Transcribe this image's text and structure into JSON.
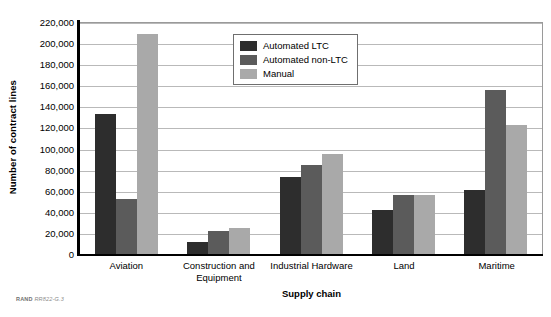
{
  "credit": {
    "org": "RAND",
    "code": "RR822-G.3"
  },
  "legend": {
    "position": "upper-center",
    "items": [
      {
        "label": "Automated LTC",
        "color": "#2d2d2d"
      },
      {
        "label": "Automated non-LTC",
        "color": "#5b5b5b"
      },
      {
        "label": "Manual",
        "color": "#a9a9a9"
      }
    ]
  },
  "chart_data": {
    "type": "bar",
    "title": "",
    "subtitle": "",
    "xlabel": "Supply chain",
    "ylabel": "Number of contract lines",
    "ylim": [
      0,
      220000
    ],
    "ytick_step": 20000,
    "ytick_labels": [
      "220,000",
      "200,000",
      "180,000",
      "160,000",
      "140,000",
      "120,000",
      "100,000",
      "80,000",
      "60,000",
      "40,000",
      "20,000",
      "0"
    ],
    "grid": true,
    "legend_position": "upper-center",
    "categories": [
      "Aviation",
      "Construction and Equipment",
      "Industrial Hardware",
      "Land",
      "Maritime"
    ],
    "series": [
      {
        "name": "Automated LTC",
        "color": "#2d2d2d",
        "values": [
          133000,
          11000,
          73000,
          42000,
          60500
        ]
      },
      {
        "name": "Automated non-LTC",
        "color": "#5b5b5b",
        "values": [
          52000,
          22000,
          84000,
          55500,
          156000
        ]
      },
      {
        "name": "Manual",
        "color": "#a9a9a9",
        "values": [
          208500,
          25000,
          95000,
          56000,
          122000
        ]
      }
    ]
  }
}
